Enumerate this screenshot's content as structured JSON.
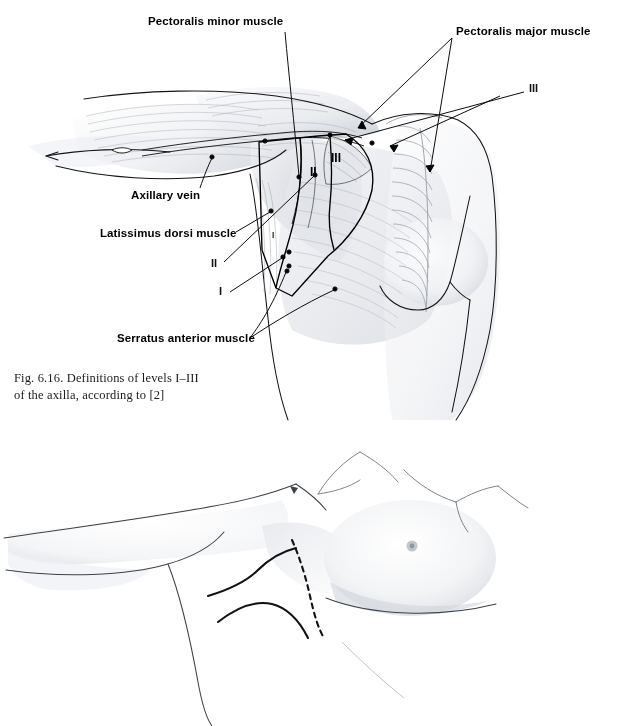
{
  "page": {
    "background_color": "#ffffff",
    "width": 617,
    "height": 726,
    "ink_color": "#000000",
    "shading_color": "#b9bcc4"
  },
  "figure_616": {
    "caption": "Fig. 6.16. Definitions of levels I–III\nof the axilla, according to [2]",
    "subject": "anterior chest wall and axilla with arm abducted, showing axillary lymph node levels",
    "labels": [
      {
        "id": "pectoralis-minor",
        "text": "Pectoralis minor muscle",
        "x": 148,
        "y": 22
      },
      {
        "id": "pectoralis-major",
        "text": "Pectoralis major muscle",
        "x": 456,
        "y": 32
      },
      {
        "id": "axillary-vein",
        "text": "Axillary vein",
        "x": 131,
        "y": 196
      },
      {
        "id": "latissimus-dorsi",
        "text": "Latissimus dorsi muscle",
        "x": 100,
        "y": 234
      },
      {
        "id": "serratus-anterior",
        "text": "Serratus anterior muscle",
        "x": 117,
        "y": 339
      }
    ],
    "level_tags": [
      {
        "id": "level-III-leader",
        "text": "III",
        "x": 529,
        "y": 88,
        "style": "leader"
      },
      {
        "id": "level-III-inner",
        "text": "III",
        "x": 331,
        "y": 158,
        "style": "inner"
      },
      {
        "id": "level-II-inner",
        "text": "II",
        "x": 310,
        "y": 172,
        "style": "inner"
      },
      {
        "id": "level-I-inner",
        "text": "I",
        "x": 272,
        "y": 236,
        "style": "inner-small"
      },
      {
        "id": "level-II-leader",
        "text": "II",
        "x": 211,
        "y": 263,
        "style": "leader"
      },
      {
        "id": "level-I-leader",
        "text": "I",
        "x": 219,
        "y": 291,
        "style": "leader"
      }
    ]
  },
  "figure_617": {
    "caption": "Fig. 6.17. Axillary dissection (different incision lines)",
    "subject": "raised arm and lateral breast showing alternative axillary incision lines",
    "incision_lines": [
      {
        "id": "incision-dashed-vertical",
        "style": "dashed"
      },
      {
        "id": "incision-solid-upper",
        "style": "solid"
      },
      {
        "id": "incision-solid-lower",
        "style": "solid"
      }
    ]
  }
}
